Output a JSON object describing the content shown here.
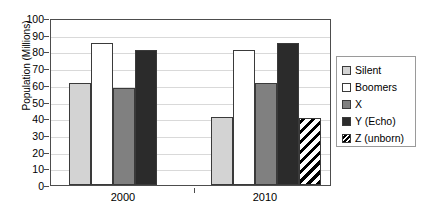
{
  "chart_data": {
    "type": "bar",
    "title": "",
    "xlabel": "",
    "ylabel": "Population (Millions)",
    "categories": [
      "2000",
      "2010"
    ],
    "ylim": [
      0,
      100
    ],
    "ytick_step": 10,
    "yticks": [
      "100",
      "90",
      "80",
      "70",
      "60",
      "50",
      "40",
      "30",
      "20",
      "10",
      "0"
    ],
    "grid": true,
    "legend_position": "right",
    "series": [
      {
        "name": "Silent",
        "values": [
          61,
          41
        ],
        "color": "#d3d3d3",
        "pattern": "solid"
      },
      {
        "name": "Boomers",
        "values": [
          85,
          81
        ],
        "color": "#ffffff",
        "pattern": "solid"
      },
      {
        "name": "X",
        "values": [
          58,
          61
        ],
        "color": "#808080",
        "pattern": "solid"
      },
      {
        "name": "Y (Echo)",
        "values": [
          81,
          85
        ],
        "color": "#2b2b2b",
        "pattern": "solid"
      },
      {
        "name": "Z (unborn)",
        "values": [
          null,
          40
        ],
        "color": "#ffffff",
        "pattern": "diagonal-hatch"
      }
    ]
  },
  "colors": {
    "axis": "#4d4d4d",
    "gridline": "#d9d9d9",
    "bar_outline": "#3a3a3a",
    "legend_border": "#9a9a9a",
    "background": "#ffffff"
  }
}
